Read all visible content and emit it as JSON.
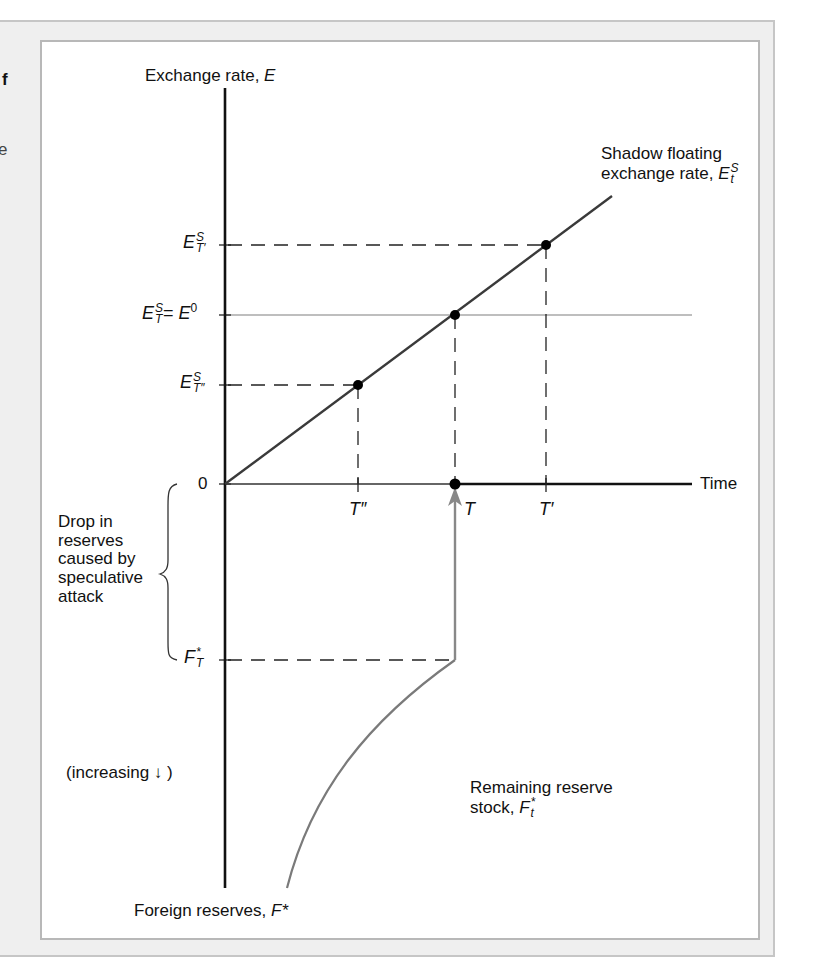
{
  "page": {
    "edge_text_1": "f",
    "edge_text_2": "e"
  },
  "figure": {
    "y_axis_label_text": "Exchange rate, ",
    "y_axis_label_var": "E",
    "x_axis_label": "Time",
    "bottom_axis_label_text": "Foreign reserves, ",
    "bottom_axis_label_var": "F*",
    "shadow_line_label_line1": "Shadow floating",
    "shadow_line_label_line2": "exchange rate, ",
    "shadow_var": "E",
    "shadow_sup": "S",
    "shadow_sub": "t",
    "remaining_label_line1": "Remaining reserve",
    "remaining_label_line2": "stock, ",
    "remaining_var": "F",
    "remaining_sup": "*",
    "remaining_sub": "t",
    "drop_label_lines": [
      "Drop in",
      "reserves",
      "caused by",
      "speculative",
      "attack"
    ],
    "increasing_label": "(increasing ↓ )",
    "origin_label": "0",
    "y_ticks": {
      "e_t_prime": {
        "var": "E",
        "sup": "S",
        "sub": "T′"
      },
      "e_t": {
        "var": "E",
        "sup": "S",
        "sub": "T",
        "eq": "= ",
        "rhs_var": "E",
        "rhs_sup": "0"
      },
      "e_t_dprime": {
        "var": "E",
        "sup": "S",
        "sub": "T″"
      },
      "f_t": {
        "var": "F",
        "sup": "*",
        "sub": "T"
      }
    },
    "x_ticks": {
      "t_dprime": "T″",
      "t": "T",
      "t_prime": "T′"
    },
    "colors": {
      "axis": "#111111",
      "shadow_line": "#3a3a3a",
      "reserve_curve": "#7a7a7a",
      "attack_arrow": "#888888",
      "e0_line": "#a8a8a8",
      "frame_bg": "#efefef"
    }
  }
}
